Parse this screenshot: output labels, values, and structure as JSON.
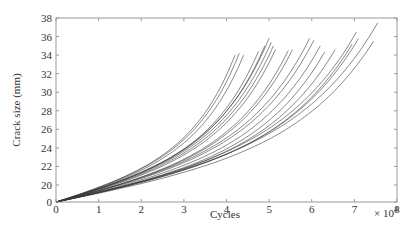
{
  "chart_data": {
    "type": "line",
    "title": "",
    "xlabel": "Cycles",
    "ylabel": "Crack size (mm)",
    "x_multiplier_label": "× 10",
    "x_multiplier_exponent": "4",
    "xlim": [
      0,
      8
    ],
    "ylim": [
      0,
      38
    ],
    "y_axis_break": {
      "from": 0,
      "to": 20
    },
    "xticks": [
      "0",
      "1",
      "2",
      "3",
      "4",
      "5",
      "6",
      "7",
      "8"
    ],
    "yticks": [
      "0",
      "20",
      "22",
      "24",
      "26",
      "28",
      "30",
      "32",
      "34",
      "36",
      "38"
    ],
    "grid": false,
    "legend": null,
    "line_color": "#3a3a3a",
    "series_note": "Many crack-growth trajectories starting at (0, 0) and curving upward; x in units of 10^4 cycles",
    "series": [
      {
        "name": "c1",
        "end_x": 4.2,
        "end_y": 34.0,
        "mid_y": 25.5
      },
      {
        "name": "c2",
        "end_x": 4.3,
        "end_y": 34.2,
        "mid_y": 25.0
      },
      {
        "name": "c3",
        "end_x": 4.4,
        "end_y": 34.0,
        "mid_y": 24.8
      },
      {
        "name": "c4",
        "end_x": 4.75,
        "end_y": 34.4,
        "mid_y": 24.2
      },
      {
        "name": "c5",
        "end_x": 4.9,
        "end_y": 35.0,
        "mid_y": 24.0
      },
      {
        "name": "c6",
        "end_x": 5.0,
        "end_y": 35.8,
        "mid_y": 23.9
      },
      {
        "name": "c7",
        "end_x": 5.05,
        "end_y": 35.4,
        "mid_y": 23.8
      },
      {
        "name": "c8",
        "end_x": 5.1,
        "end_y": 35.0,
        "mid_y": 23.6
      },
      {
        "name": "c9",
        "end_x": 5.15,
        "end_y": 34.6,
        "mid_y": 23.5
      },
      {
        "name": "c10",
        "end_x": 5.45,
        "end_y": 34.5,
        "mid_y": 23.0
      },
      {
        "name": "c11",
        "end_x": 5.55,
        "end_y": 34.6,
        "mid_y": 22.9
      },
      {
        "name": "c12",
        "end_x": 5.95,
        "end_y": 35.8,
        "mid_y": 22.5
      },
      {
        "name": "c13",
        "end_x": 6.05,
        "end_y": 35.6,
        "mid_y": 22.4
      },
      {
        "name": "c14",
        "end_x": 6.2,
        "end_y": 35.0,
        "mid_y": 22.2
      },
      {
        "name": "c15",
        "end_x": 6.3,
        "end_y": 34.3,
        "mid_y": 22.0
      },
      {
        "name": "c16",
        "end_x": 6.55,
        "end_y": 34.6,
        "mid_y": 21.8
      },
      {
        "name": "c17",
        "end_x": 6.95,
        "end_y": 35.2,
        "mid_y": 21.5
      },
      {
        "name": "c18",
        "end_x": 7.05,
        "end_y": 36.5,
        "mid_y": 21.4
      },
      {
        "name": "c19",
        "end_x": 7.1,
        "end_y": 35.8,
        "mid_y": 21.3
      },
      {
        "name": "c20",
        "end_x": 7.45,
        "end_y": 35.5,
        "mid_y": 21.0
      },
      {
        "name": "c21",
        "end_x": 7.55,
        "end_y": 37.5,
        "mid_y": 20.9
      }
    ]
  }
}
